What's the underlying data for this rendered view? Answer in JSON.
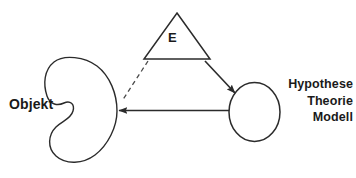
{
  "diagram": {
    "stroke_color": "#2b2b2b",
    "text_color": "#1a1a1a",
    "background_color": "#ffffff",
    "nodes": {
      "object_blob": {
        "label": "Objekt",
        "shape": "blob"
      },
      "triangle": {
        "label": "E",
        "shape": "triangle"
      },
      "circle": {
        "shape": "circle",
        "label_lines": [
          "Hypothese",
          "Theorie",
          "Modell"
        ],
        "line1": "Hypothese",
        "line2": "Theorie",
        "line3": "Modell"
      }
    },
    "connectors": [
      {
        "name": "triangle-to-object-dashed",
        "style": "dashed",
        "arrowhead": false,
        "from": "triangle",
        "to": "object_blob"
      },
      {
        "name": "triangle-to-circle-arrow",
        "style": "solid",
        "arrowhead": true,
        "from": "triangle",
        "to": "circle"
      },
      {
        "name": "circle-to-object-arrow",
        "style": "solid",
        "arrowhead": true,
        "from": "circle",
        "to": "object_blob"
      }
    ]
  }
}
